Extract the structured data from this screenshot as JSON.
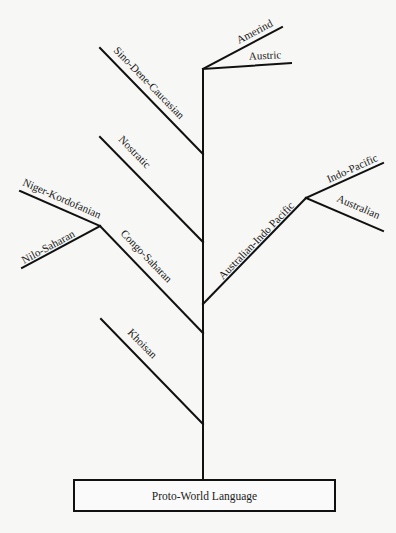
{
  "diagram": {
    "type": "language-family-tree",
    "root": {
      "label": "Proto-World Language"
    },
    "branches": [
      {
        "id": "khoisan",
        "label": "Khoisan"
      },
      {
        "id": "congo-saharan",
        "label": "Congo-Saharan",
        "children": [
          {
            "id": "niger-kordofanian",
            "label": "Niger-Kordofanian"
          },
          {
            "id": "nilo-saharan",
            "label": "Nilo-Saharan"
          }
        ]
      },
      {
        "id": "australian-indo-pacific",
        "label": "Australian-Indo Pacific",
        "children": [
          {
            "id": "indo-pacific",
            "label": "Indo-Pacific"
          },
          {
            "id": "australian",
            "label": "Australian"
          }
        ]
      },
      {
        "id": "nostratic",
        "label": "Nostratic"
      },
      {
        "id": "sino-dene-caucasian",
        "label": "Sino-Dene-Caucasian"
      },
      {
        "id": "amerind",
        "label": "Amerind"
      },
      {
        "id": "austric",
        "label": "Austric"
      }
    ]
  },
  "labels": {
    "root": "Proto-World Language",
    "khoisan": "Khoisan",
    "congo_saharan": "Congo-Saharan",
    "niger_kordofanian": "Niger-Kordofanian",
    "nilo_saharan": "Nilo-Saharan",
    "australian_indo_pacific": "Australian-Indo Pacific",
    "indo_pacific": "Indo-Pacific",
    "australian": "Australian",
    "nostratic": "Nostratic",
    "sino_dene_caucasian": "Sino-Dene-Caucasian",
    "amerind": "Amerind",
    "austric": "Austric"
  },
  "colors": {
    "line": "#111111",
    "background": "#f7f7f5",
    "text": "#1a1a1a"
  }
}
